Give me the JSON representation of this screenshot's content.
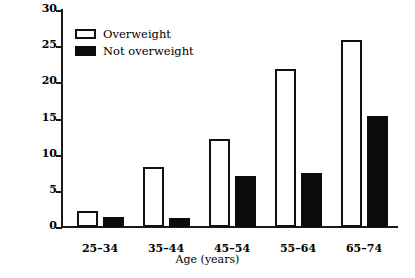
{
  "chart_data": {
    "type": "bar",
    "title": "",
    "xlabel": "Age (years)",
    "ylabel": "Percentage",
    "categories": [
      "25–34",
      "35–44",
      "45–54",
      "55–64",
      "65–74"
    ],
    "series": [
      {
        "name": "Overweight",
        "values": [
          2.2,
          8.3,
          12.2,
          21.8,
          25.9
        ],
        "fill": "#ffffff",
        "edge": "#111111"
      },
      {
        "name": "Not overweight",
        "values": [
          1.4,
          1.2,
          7.1,
          7.4,
          15.3
        ],
        "fill": "#0b0b0b",
        "edge": "#0b0b0b"
      }
    ],
    "ylim": [
      0,
      30
    ],
    "yticks": [
      0,
      5,
      10,
      15,
      20,
      25,
      30
    ],
    "ytick_labels": [
      "0",
      "5",
      "10",
      "15",
      "20",
      "25",
      "30"
    ],
    "grid": false,
    "legend_position": "upper left",
    "legend_entries": [
      "Overweight",
      "Not overweight"
    ]
  }
}
